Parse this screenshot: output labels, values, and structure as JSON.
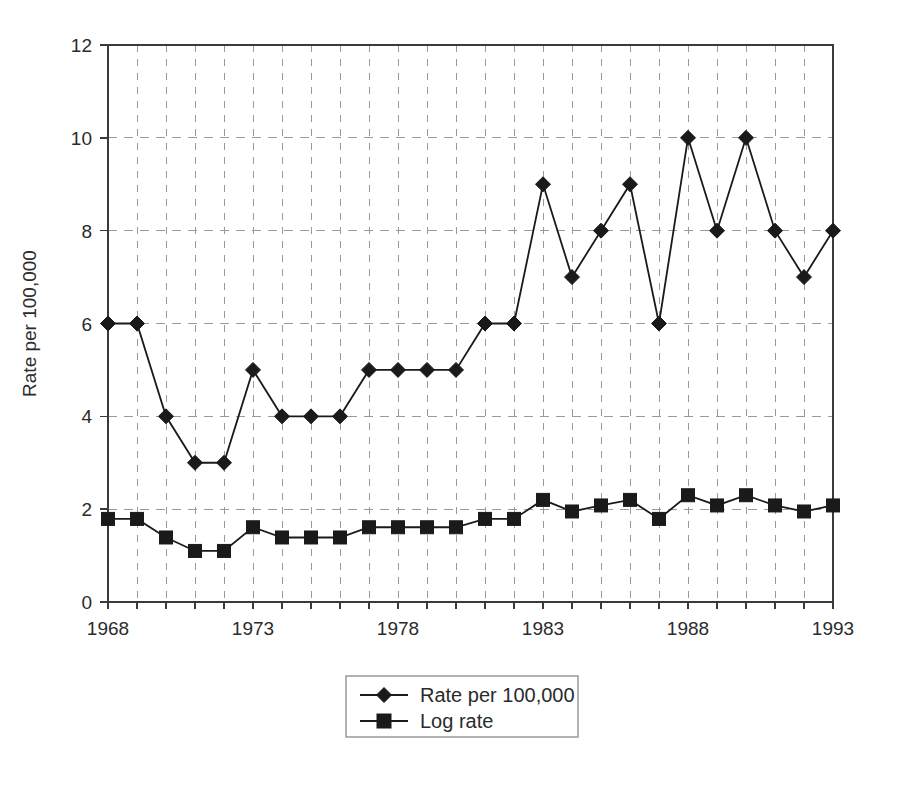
{
  "chart_data": {
    "type": "line",
    "title": "",
    "subtitle": "",
    "xlabel": "",
    "ylabel": "Rate per 100,000",
    "x": [
      1968,
      1969,
      1970,
      1971,
      1972,
      1973,
      1974,
      1975,
      1976,
      1977,
      1978,
      1979,
      1980,
      1981,
      1982,
      1983,
      1984,
      1985,
      1986,
      1987,
      1988,
      1989,
      1990,
      1991,
      1992,
      1993
    ],
    "xtick_labels": [
      "1968",
      "1973",
      "1978",
      "1983",
      "1988",
      "1993"
    ],
    "xtick_values": [
      1968,
      1973,
      1978,
      1983,
      1988,
      1993
    ],
    "ytick_labels": [
      "0",
      "2",
      "4",
      "6",
      "8",
      "10",
      "12"
    ],
    "ytick_values": [
      0,
      2,
      4,
      6,
      8,
      10,
      12
    ],
    "xlim": [
      1968,
      1993
    ],
    "ylim": [
      0,
      12
    ],
    "grid": "dashed-both",
    "legend_position": "bottom-center",
    "series": [
      {
        "name": "Rate per 100,000",
        "marker": "diamond",
        "color": "#1a1a1a",
        "values": [
          6,
          6,
          4,
          3,
          3,
          5,
          4,
          4,
          4,
          5,
          5,
          5,
          5,
          6,
          6,
          9,
          7,
          8,
          9,
          6,
          10,
          8,
          10,
          8,
          7,
          8
        ]
      },
      {
        "name": "Log rate",
        "marker": "square",
        "color": "#1a1a1a",
        "values": [
          1.79,
          1.79,
          1.39,
          1.1,
          1.1,
          1.61,
          1.39,
          1.39,
          1.39,
          1.61,
          1.61,
          1.61,
          1.61,
          1.79,
          1.79,
          2.2,
          1.95,
          2.08,
          2.2,
          1.79,
          2.3,
          2.08,
          2.3,
          2.08,
          1.95,
          2.08
        ]
      }
    ]
  },
  "legend": {
    "items": [
      {
        "label": "Rate per 100,000",
        "marker": "diamond"
      },
      {
        "label": "Log rate",
        "marker": "square"
      }
    ]
  },
  "axes": {
    "y_title": "Rate per 100,000"
  }
}
